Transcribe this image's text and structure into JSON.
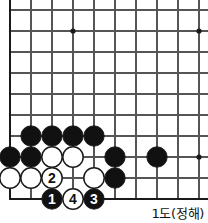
{
  "diagram": {
    "type": "go-board",
    "caption": "1도(정해)",
    "board": {
      "origin_x": 10,
      "origin_y": 10,
      "spacing": 21,
      "cols": 10,
      "rows": 10,
      "stone_radius": 10.2,
      "edge_left": true,
      "edge_bottom": true,
      "edge_top_partial": true,
      "line_color": "#555555",
      "edge_color": "#1a1a1a",
      "black_color": "#111111",
      "white_color": "#ffffff",
      "background": "#ffffff"
    },
    "star_points": [
      {
        "col": 3,
        "row": 1
      },
      {
        "col": 9,
        "row": 1
      },
      {
        "col": 9,
        "row": 7
      }
    ],
    "stones": [
      {
        "col": 1,
        "row": 6,
        "color": "black",
        "label": ""
      },
      {
        "col": 2,
        "row": 6,
        "color": "black",
        "label": ""
      },
      {
        "col": 3,
        "row": 6,
        "color": "black",
        "label": ""
      },
      {
        "col": 4,
        "row": 6,
        "color": "black",
        "label": ""
      },
      {
        "col": 0,
        "row": 7,
        "color": "black",
        "label": ""
      },
      {
        "col": 1,
        "row": 7,
        "color": "black",
        "label": ""
      },
      {
        "col": 2,
        "row": 7,
        "color": "white",
        "label": ""
      },
      {
        "col": 3,
        "row": 7,
        "color": "white",
        "label": ""
      },
      {
        "col": 5,
        "row": 7,
        "color": "black",
        "label": ""
      },
      {
        "col": 7,
        "row": 7,
        "color": "black",
        "label": ""
      },
      {
        "col": 0,
        "row": 8,
        "color": "white",
        "label": ""
      },
      {
        "col": 1,
        "row": 8,
        "color": "white",
        "label": ""
      },
      {
        "col": 2,
        "row": 8,
        "color": "white",
        "label": "2"
      },
      {
        "col": 4,
        "row": 8,
        "color": "white",
        "label": ""
      },
      {
        "col": 5,
        "row": 8,
        "color": "black",
        "label": ""
      },
      {
        "col": 2,
        "row": 9,
        "color": "black",
        "label": "1"
      },
      {
        "col": 3,
        "row": 9,
        "color": "white",
        "label": "4"
      },
      {
        "col": 4,
        "row": 9,
        "color": "black",
        "label": "3"
      }
    ]
  }
}
